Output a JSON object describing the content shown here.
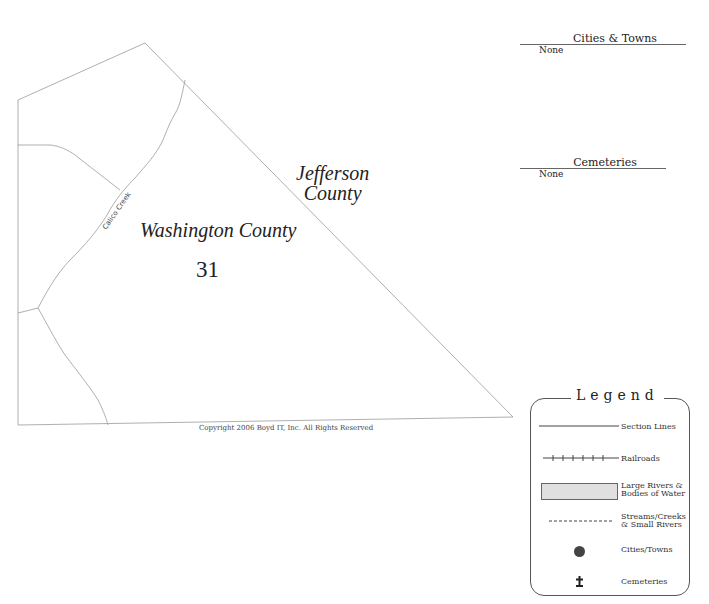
{
  "map": {
    "county_west": "Washington County",
    "county_east_line1": "Jefferson",
    "county_east_line2": "County",
    "section_number": "31",
    "creek_label": "Calico Creek",
    "copyright": "Copyright 2006 Boyd IT, Inc. All Rights Reserved"
  },
  "cities": {
    "title": "Cities & Towns",
    "value": "None"
  },
  "cemeteries": {
    "title": "Cemeteries",
    "value": "None"
  },
  "legend": {
    "title": "Legend",
    "items": [
      {
        "label": "Section Lines",
        "symbol": "solid-line"
      },
      {
        "label": "Railroads",
        "symbol": "railroad-line"
      },
      {
        "label_line1": "Large Rivers &",
        "label_line2": "Bodies of Water",
        "symbol": "gray-box"
      },
      {
        "label_line1": "Streams/Creeks",
        "label_line2": "& Small Rivers",
        "symbol": "dashed-line"
      },
      {
        "label": "Cities/Towns",
        "symbol": "dot"
      },
      {
        "label": "Cemeteries",
        "symbol": "cross"
      }
    ],
    "colors": {
      "water": "#e0e0e0",
      "city": "#444444"
    }
  }
}
